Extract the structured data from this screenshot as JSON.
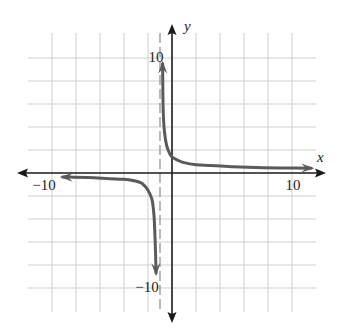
{
  "chart_data": {
    "type": "line",
    "title": "",
    "xlabel": "x",
    "ylabel": "y",
    "xlim": [
      -12,
      12
    ],
    "ylim": [
      -12,
      12
    ],
    "grid": true,
    "grid_step": 2,
    "x_tick_labels": [
      {
        "value": -10,
        "label": "−10"
      },
      {
        "value": 10,
        "label": "10"
      }
    ],
    "y_tick_labels": [
      {
        "value": 10,
        "label": "10"
      },
      {
        "value": -10,
        "label": "−10"
      }
    ],
    "asymptotes": {
      "vertical": [
        {
          "x": -1,
          "style": "dashed"
        }
      ],
      "horizontal": [
        {
          "y": 0
        }
      ]
    },
    "series": [
      {
        "name": "right-branch",
        "arrows": "both",
        "points": [
          [
            -0.78,
            9.5
          ],
          [
            -0.76,
            7.0
          ],
          [
            -0.72,
            5.0
          ],
          [
            -0.62,
            3.5
          ],
          [
            -0.45,
            2.4
          ],
          [
            -0.2,
            1.7
          ],
          [
            0,
            1.4
          ],
          [
            0.5,
            1.1
          ],
          [
            1,
            0.9
          ],
          [
            2,
            0.72
          ],
          [
            3.2,
            0.65
          ],
          [
            5,
            0.55
          ],
          [
            7,
            0.48
          ],
          [
            9,
            0.44
          ],
          [
            11.6,
            0.42
          ]
        ]
      },
      {
        "name": "left-branch",
        "arrows": "both",
        "points": [
          [
            -9.1,
            -0.35
          ],
          [
            -7,
            -0.4
          ],
          [
            -5.2,
            -0.5
          ],
          [
            -4,
            -0.55
          ],
          [
            -2.7,
            -0.8
          ],
          [
            -2.3,
            -1.1
          ],
          [
            -2,
            -1.5
          ],
          [
            -1.67,
            -2.3
          ],
          [
            -1.5,
            -3.7
          ],
          [
            -1.42,
            -5.5
          ],
          [
            -1.37,
            -7.0
          ],
          [
            -1.33,
            -8.7
          ]
        ]
      }
    ]
  },
  "labels": {
    "x_axis": "x",
    "y_axis": "y",
    "x_min": "−10",
    "x_max": "10",
    "y_max": "10",
    "y_min": "−10"
  },
  "colors": {
    "grid": "#cfcfcf",
    "axis": "#1a1a1a",
    "curve": "#5a5a5a",
    "asymptote": "#8a8a8a"
  }
}
